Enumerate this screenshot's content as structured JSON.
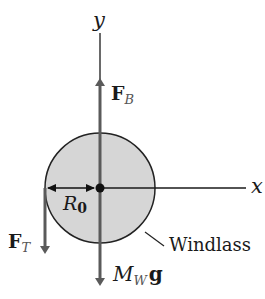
{
  "diagram": {
    "type": "free-body diagram",
    "axes": {
      "x_label": "x",
      "y_label": "y"
    },
    "forces": [
      {
        "id": "FB",
        "symbol": "F",
        "subscript": "B",
        "direction": "up"
      },
      {
        "id": "FT",
        "symbol": "F",
        "subscript": "T",
        "direction": "down"
      },
      {
        "id": "MWg",
        "symbol": "M",
        "subscript": "W",
        "suffix": "g",
        "direction": "down"
      }
    ],
    "radius": {
      "symbol": "R",
      "subscript": "0"
    },
    "body": {
      "label": "Windlass",
      "shape": "circle",
      "fill": "#d6d6d6"
    },
    "colors": {
      "force_arrow": "#5a5a5a",
      "axis": "#1a1a1a",
      "outline": "#222222"
    }
  }
}
